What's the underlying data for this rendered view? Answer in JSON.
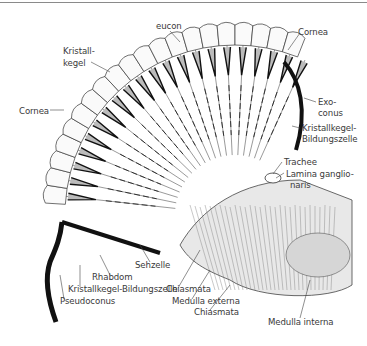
{
  "figure": {
    "labels": {
      "eucon": "eucon",
      "kristallkegel": [
        "Kristall-",
        "kegel"
      ],
      "cornea_left": "Cornea",
      "cornea_right": "Cornea",
      "exoconus": [
        "Exo-",
        "conus"
      ],
      "kristallkegel_bildungszelle_right": [
        "Kristallkegel-",
        "Bildungszelle"
      ],
      "trachee": "Trachee",
      "lamina_ganglionaris": [
        "Lamina ganglio-",
        "naris"
      ],
      "sehzelle": "Sehzelle",
      "rhabdom": "Rhabdom",
      "kristallkegel_bildungszelle_bottom": "Kristallkegel-Bildungszelle",
      "pseudoconus": "Pseudoconus",
      "chiasmata_1": "Chiasmata",
      "medulla_externa": "Medulla externa",
      "chiasmata_2": "Chiasmata",
      "medulla_interna": "Medulla interna"
    }
  }
}
